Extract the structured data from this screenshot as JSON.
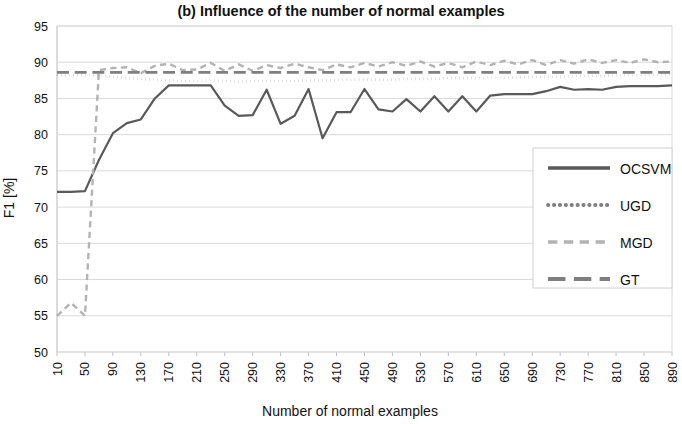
{
  "chart_data": {
    "type": "line",
    "title": "(b) Influence of the number of normal examples",
    "xlabel": "Number of normal examples",
    "ylabel": "F1 [%]",
    "ylim": [
      50,
      95
    ],
    "ytick_step": 5,
    "yticks": [
      50,
      55,
      60,
      65,
      70,
      75,
      80,
      85,
      90,
      95
    ],
    "grid": true,
    "legend_position": "right-middle",
    "categories": [
      10,
      30,
      50,
      70,
      90,
      110,
      130,
      150,
      170,
      190,
      210,
      230,
      250,
      270,
      290,
      310,
      330,
      350,
      370,
      390,
      410,
      430,
      450,
      470,
      490,
      510,
      530,
      550,
      570,
      590,
      610,
      630,
      650,
      670,
      690,
      710,
      730,
      750,
      770,
      790,
      810,
      830,
      850,
      870,
      890
    ],
    "xtick_labels": [
      10,
      50,
      90,
      130,
      170,
      210,
      250,
      290,
      330,
      370,
      410,
      450,
      490,
      530,
      570,
      610,
      650,
      690,
      730,
      770,
      810,
      850,
      890
    ],
    "series": [
      {
        "name": "OCSVM",
        "color": "#595959",
        "dash": "solid",
        "width": 2.2,
        "values": [
          72.1,
          72.1,
          72.2,
          76.5,
          80.2,
          81.6,
          82.1,
          85.0,
          86.8,
          86.8,
          86.8,
          86.8,
          84.0,
          82.6,
          82.7,
          86.2,
          81.5,
          82.6,
          86.3,
          79.5,
          83.1,
          83.1,
          86.3,
          83.5,
          83.2,
          84.9,
          83.2,
          85.3,
          83.2,
          85.3,
          83.2,
          85.4,
          85.6,
          85.6,
          85.6,
          86.0,
          86.6,
          86.2,
          86.3,
          86.2,
          86.6,
          86.7,
          86.7,
          86.7,
          86.8
        ]
      },
      {
        "name": "UGD",
        "color": "#808080",
        "dash": "dotted",
        "width": 2.6,
        "values": [
          88.2,
          88.2,
          88.2,
          88.2,
          88.0,
          87.8,
          87.7,
          87.6,
          87.5,
          87.4,
          87.4,
          87.5,
          87.4,
          87.3,
          87.4,
          87.4,
          87.4,
          87.4,
          87.5,
          87.5,
          87.5,
          87.6,
          87.6,
          87.6,
          87.6,
          87.7,
          87.7,
          87.7,
          87.8,
          87.8,
          87.8,
          87.9,
          87.9,
          87.9,
          88.0,
          88.0,
          88.0,
          88.1,
          88.1,
          88.1,
          88.2,
          88.2,
          88.2,
          88.3,
          88.3
        ]
      },
      {
        "name": "MGD",
        "color": "#b3b3b3",
        "dash": "dashed",
        "width": 2.4,
        "values": [
          55.0,
          56.8,
          55.0,
          88.9,
          89.2,
          89.3,
          88.5,
          89.5,
          89.8,
          88.9,
          89.0,
          89.9,
          88.8,
          89.7,
          88.8,
          89.6,
          89.2,
          89.8,
          89.3,
          88.9,
          89.7,
          89.3,
          89.9,
          89.4,
          90.0,
          89.5,
          90.1,
          89.4,
          89.9,
          89.3,
          90.1,
          89.6,
          90.2,
          89.7,
          90.3,
          89.6,
          90.3,
          89.8,
          90.4,
          89.9,
          90.3,
          89.9,
          90.4,
          90.0,
          90.1
        ]
      },
      {
        "name": "GT",
        "color": "#7f7f7f",
        "dash": "longdash",
        "width": 2.6,
        "values": [
          88.6,
          88.6,
          88.6,
          88.6,
          88.6,
          88.6,
          88.6,
          88.6,
          88.6,
          88.6,
          88.6,
          88.6,
          88.6,
          88.6,
          88.6,
          88.6,
          88.6,
          88.6,
          88.6,
          88.6,
          88.6,
          88.6,
          88.6,
          88.6,
          88.6,
          88.6,
          88.6,
          88.6,
          88.6,
          88.6,
          88.6,
          88.6,
          88.6,
          88.6,
          88.6,
          88.6,
          88.6,
          88.6,
          88.6,
          88.6,
          88.6,
          88.6,
          88.6,
          88.6,
          88.6
        ]
      }
    ]
  },
  "legend": {
    "entries": [
      {
        "label": "OCSVM"
      },
      {
        "label": "UGD"
      },
      {
        "label": "MGD"
      },
      {
        "label": "GT"
      }
    ]
  }
}
